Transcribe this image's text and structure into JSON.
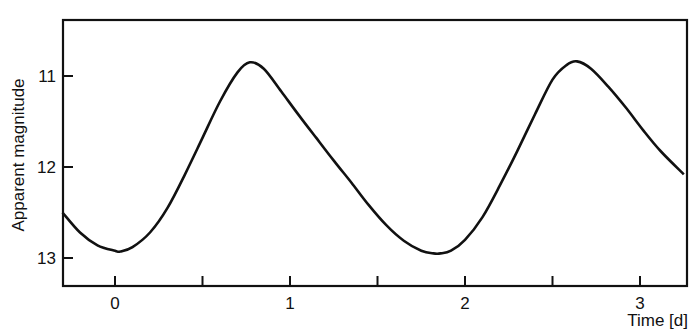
{
  "chart_data": {
    "type": "line",
    "title": "",
    "xlabel": "Time [d]",
    "ylabel": "Apparent magnitude",
    "xlim": [
      -0.3,
      3.25
    ],
    "ylim": [
      13.3,
      10.4
    ],
    "y_inverted": true,
    "grid": false,
    "legend": null,
    "x_ticks": [
      0,
      0.5,
      1,
      1.5,
      2,
      2.5,
      3
    ],
    "x_tick_labels": [
      "0",
      "",
      "1",
      "",
      "2",
      "",
      "3"
    ],
    "y_ticks": [
      11,
      12,
      13
    ],
    "y_tick_labels": [
      "11",
      "12",
      "13"
    ],
    "series": [
      {
        "name": "light curve",
        "x": [
          -0.3,
          -0.2,
          -0.1,
          0.0,
          0.03,
          0.1,
          0.2,
          0.3,
          0.4,
          0.5,
          0.6,
          0.7,
          0.77,
          0.85,
          0.95,
          1.05,
          1.15,
          1.25,
          1.35,
          1.45,
          1.55,
          1.65,
          1.75,
          1.82,
          1.86,
          1.92,
          2.0,
          2.1,
          2.2,
          2.3,
          2.4,
          2.5,
          2.58,
          2.64,
          2.72,
          2.82,
          2.92,
          3.02,
          3.12,
          3.25
        ],
        "y": [
          12.5,
          12.72,
          12.86,
          12.92,
          12.93,
          12.88,
          12.72,
          12.45,
          12.08,
          11.68,
          11.28,
          10.96,
          10.85,
          10.92,
          11.17,
          11.43,
          11.68,
          11.93,
          12.17,
          12.42,
          12.64,
          12.81,
          12.92,
          12.95,
          12.95,
          12.92,
          12.8,
          12.55,
          12.2,
          11.82,
          11.42,
          11.04,
          10.88,
          10.84,
          10.92,
          11.12,
          11.35,
          11.6,
          11.83,
          12.08
        ]
      }
    ]
  }
}
